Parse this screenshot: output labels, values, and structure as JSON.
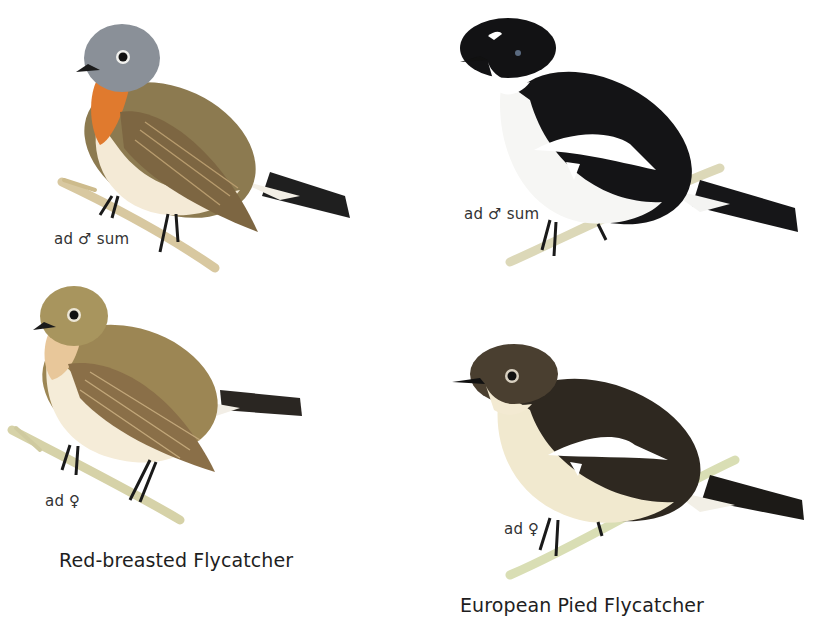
{
  "plate": {
    "background": "#ffffff",
    "species": [
      {
        "name": "Red-breasted Flycatcher",
        "figures": [
          {
            "age": "ad",
            "sex_symbol": "♂",
            "season": "sum",
            "label": "ad ♂ sum",
            "colors": {
              "head": "#8a9098",
              "throat": "#e07a2e",
              "back": "#8c7a50",
              "wing": "#7d6642",
              "belly": "#f4ead6",
              "tail": "#1f1f1f",
              "branch": "#d8c8a0"
            }
          },
          {
            "age": "ad",
            "sex_symbol": "♀",
            "season": "",
            "label": "ad ♀",
            "colors": {
              "head": "#a8955e",
              "throat": "#e8c79a",
              "back": "#9c8654",
              "wing": "#8a6f48",
              "belly": "#f5ecd8",
              "tail": "#2a2622",
              "branch": "#d6d2a8"
            }
          }
        ]
      },
      {
        "name": "European Pied Flycatcher",
        "figures": [
          {
            "age": "ad",
            "sex_symbol": "♂",
            "season": "sum",
            "label": "ad ♂ sum",
            "colors": {
              "head": "#121214",
              "throat": "#ffffff",
              "back": "#141416",
              "wing_patch": "#ffffff",
              "belly": "#f6f6f4",
              "tail": "#161618",
              "branch": "#dcd8b8"
            }
          },
          {
            "age": "ad",
            "sex_symbol": "♀",
            "season": "",
            "label": "ad ♀",
            "colors": {
              "head": "#4a3f30",
              "throat": "#f3ead2",
              "back": "#2e2820",
              "wing_patch": "#ffffff",
              "belly": "#f1e9cf",
              "tail": "#1c1a17",
              "branch": "#d9deb4"
            }
          }
        ]
      }
    ]
  }
}
